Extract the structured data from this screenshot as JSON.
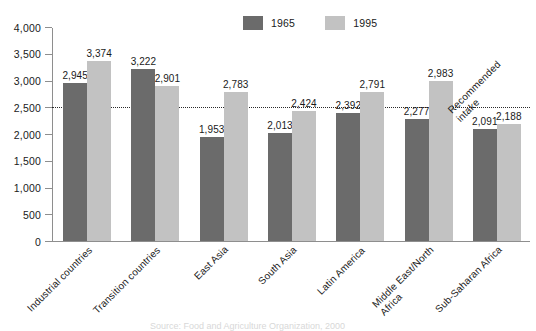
{
  "chart_data": {
    "type": "bar",
    "title": "",
    "subtitle": "",
    "xlabel": "",
    "ylabel": "",
    "ylim": [
      0,
      4000
    ],
    "yticks": [
      0,
      500,
      1000,
      1500,
      2000,
      2500,
      3000,
      3500,
      4000
    ],
    "ytick_labels": [
      "0",
      "500",
      "1,000",
      "1,500",
      "2,000",
      "2,500",
      "3,000",
      "3,500",
      "4,000"
    ],
    "grid": false,
    "legend_position": "top-center",
    "categories": [
      "Industrial countries",
      "Transition countries",
      "East Asia",
      "South Asia",
      "Latin America",
      "Middle East/North Africa",
      "Sub-Saharan Africa"
    ],
    "category_lines": [
      [
        "Industrial countries"
      ],
      [
        "Transition countries"
      ],
      [
        "East Asia"
      ],
      [
        "South Asia"
      ],
      [
        "Latin America"
      ],
      [
        "Middle East/North",
        "Africa"
      ],
      [
        "Sub-Saharan Africa"
      ]
    ],
    "series": [
      {
        "name": "1965",
        "color": "#6b6b6b",
        "values": [
          2945,
          3222,
          1953,
          2013,
          2392,
          2277,
          2091
        ],
        "value_labels": [
          "2,945",
          "3,222",
          "1,953",
          "2,013",
          "2,392",
          "2,277",
          "2,091"
        ]
      },
      {
        "name": "1995",
        "color": "#c2c2c2",
        "values": [
          3374,
          2901,
          2783,
          2424,
          2791,
          2983,
          2188
        ],
        "value_labels": [
          "3,374",
          "2,901",
          "2,783",
          "2,424",
          "2,791",
          "2,983",
          "2,188"
        ]
      }
    ],
    "reference_line": {
      "value": 2500,
      "label_lines": [
        "Recommended",
        "intake"
      ],
      "style": "dotted",
      "color": "#2a2a2a"
    },
    "source_caption": "Source: Food and Agriculture Organization, 2000"
  },
  "colors": {
    "series_1965": "#6b6b6b",
    "series_1995": "#c2c2c2",
    "axis": "#8e8e8e",
    "text": "#1a1a1a",
    "reference": "#2a2a2a",
    "background": "#ffffff"
  }
}
